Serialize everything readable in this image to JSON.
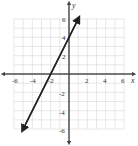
{
  "chart_data": {
    "type": "line",
    "title": "",
    "xlabel": "x",
    "ylabel": "y",
    "xlim": [
      -6,
      6
    ],
    "ylim": [
      -6,
      6
    ],
    "grid": true,
    "x_ticks": [
      "-6",
      "-4",
      "-2",
      "2",
      "4",
      "6"
    ],
    "y_ticks": [
      "6",
      "4",
      "2",
      "-2",
      "-4",
      "-6"
    ],
    "series": [
      {
        "name": "y = 2x + 4",
        "equation": "y = 2x + 4",
        "points": [
          [
            -5,
            -6
          ],
          [
            -2,
            0
          ],
          [
            0,
            4
          ],
          [
            1,
            6
          ]
        ],
        "arrows": "both",
        "color": "#222222"
      }
    ]
  },
  "labels": {
    "x_axis": "x",
    "y_axis": "y",
    "tick_x": {
      "n6": "-6",
      "n4": "-4",
      "n2": "-2",
      "p2": "2",
      "p4": "4",
      "p6": "6"
    },
    "tick_y": {
      "p6": "6",
      "p4": "4",
      "p2": "2",
      "n2": "-2",
      "n4": "-4",
      "n6": "-6"
    }
  }
}
